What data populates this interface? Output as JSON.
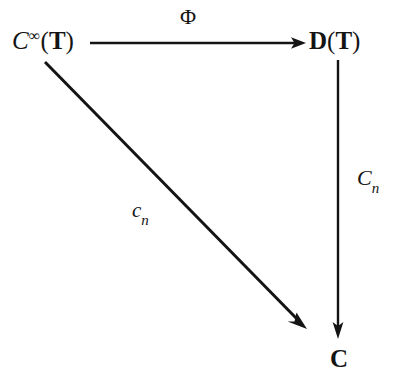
{
  "diagram": {
    "type": "commutative-triangle",
    "background_color": "#ffffff",
    "ink_color": "#141414",
    "nodes": [
      {
        "id": "top-left",
        "name": "smooth-functions-on-torus",
        "parts": {
          "base": "C",
          "superscript": "∞",
          "open_paren": "(",
          "argument": "T",
          "close_paren": ")"
        },
        "plain_text": "C∞(T)",
        "x": 12,
        "y": 27
      },
      {
        "id": "top-right",
        "name": "distributions-on-torus",
        "parts": {
          "base": "D",
          "open_paren": "(",
          "argument": "T",
          "close_paren": ")"
        },
        "plain_text": "D(T)",
        "x": 309,
        "y": 28
      },
      {
        "id": "bottom",
        "name": "complex-numbers",
        "parts": {
          "base": "C"
        },
        "plain_text": "C",
        "x": 330,
        "y": 346
      }
    ],
    "arrows": [
      {
        "id": "horizontal",
        "name": "phi-map",
        "from": "top-left",
        "to": "top-right",
        "x1": 90,
        "y1": 43,
        "x2": 305,
        "y2": 43,
        "label": {
          "text": "Φ",
          "style": "upright",
          "x": 180,
          "y": 6
        }
      },
      {
        "id": "vertical",
        "name": "Cn-functional",
        "from": "top-right",
        "to": "bottom",
        "x1": 338,
        "y1": 60,
        "x2": 338,
        "y2": 338,
        "label": {
          "base": "C",
          "subscript": "n",
          "text": "Cn",
          "style": "italic",
          "x": 357,
          "y": 167
        }
      },
      {
        "id": "diagonal",
        "name": "cn-coefficient",
        "from": "top-left",
        "to": "bottom",
        "x1": 45,
        "y1": 62,
        "x2": 306,
        "y2": 328,
        "label": {
          "base": "c",
          "subscript": "n",
          "text": "cn",
          "style": "italic",
          "x": 132,
          "y": 200
        }
      }
    ]
  }
}
